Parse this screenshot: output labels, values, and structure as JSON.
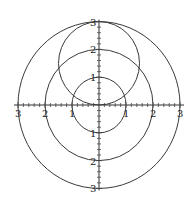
{
  "chart_data": {
    "type": "polar",
    "title": "",
    "xlim": [
      -3,
      3
    ],
    "ylim": [
      -3,
      3
    ],
    "grid": false,
    "tick_spacing": 0.2,
    "x_tick_labels": [
      "3",
      "2",
      "1",
      "1",
      "2",
      "3"
    ],
    "x_tick_label_values": [
      -3,
      -2,
      -1,
      1,
      2,
      3
    ],
    "y_tick_labels": [
      "3",
      "2",
      "1",
      "1",
      "2",
      "3"
    ],
    "y_tick_label_values": [
      3,
      2,
      1,
      -1,
      -2,
      -3
    ],
    "series": [
      {
        "name": "r = 1",
        "type": "circle",
        "cx": 0,
        "cy": 0,
        "r": 1
      },
      {
        "name": "r = 2",
        "type": "circle",
        "cx": 0,
        "cy": 0,
        "r": 2
      },
      {
        "name": "r = 3",
        "type": "circle",
        "cx": 0,
        "cy": 0,
        "r": 3
      },
      {
        "name": "r = 3 sin(theta)",
        "type": "circle",
        "cx": 0,
        "cy": 1.5,
        "r": 1.5
      }
    ],
    "colors": {
      "curve": "#3a3a3a",
      "axis": "#333333",
      "background": "#ffffff"
    }
  },
  "labels": {
    "x": [
      {
        "text": "3",
        "value": -3
      },
      {
        "text": "2",
        "value": -2
      },
      {
        "text": "1",
        "value": -1
      },
      {
        "text": "1",
        "value": 1
      },
      {
        "text": "2",
        "value": 2
      },
      {
        "text": "3",
        "value": 3
      }
    ],
    "y": [
      {
        "text": "3",
        "value": 3
      },
      {
        "text": "2",
        "value": 2
      },
      {
        "text": "1",
        "value": 1
      },
      {
        "text": "1",
        "value": -1
      },
      {
        "text": "2",
        "value": -2
      },
      {
        "text": "3",
        "value": -3
      }
    ]
  }
}
